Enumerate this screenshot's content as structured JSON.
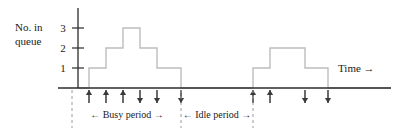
{
  "figure": {
    "kind": "queueing-step-diagram",
    "axis_color": "#2b2b2b",
    "step_color": "#bdbdbd",
    "arrow_color": "#3a3a3a",
    "guide_color": "#9a9a9a",
    "background": "#ffffff"
  },
  "y_axis": {
    "label_line1": "No. in",
    "label_line2": "queue",
    "ticks": [
      {
        "value": "3",
        "y": 28
      },
      {
        "value": "2",
        "y": 48
      },
      {
        "value": "1",
        "y": 68
      }
    ],
    "axis_x": 78,
    "axis_top": 8,
    "baseline_y": 88
  },
  "x_axis": {
    "label": "Time →",
    "label_x": 338,
    "label_y": 72,
    "start_x": 58,
    "end_x": 391
  },
  "chart_data": {
    "type": "line",
    "title": "",
    "xlabel": "Time",
    "ylabel": "No. in queue",
    "ylim": [
      0,
      3
    ],
    "step_points": [
      {
        "x": 78,
        "y": 0
      },
      {
        "x": 89,
        "y": 0
      },
      {
        "x": 89,
        "y": 1
      },
      {
        "x": 106,
        "y": 1
      },
      {
        "x": 106,
        "y": 2
      },
      {
        "x": 123,
        "y": 2
      },
      {
        "x": 123,
        "y": 3
      },
      {
        "x": 140,
        "y": 3
      },
      {
        "x": 140,
        "y": 2
      },
      {
        "x": 157,
        "y": 2
      },
      {
        "x": 157,
        "y": 1
      },
      {
        "x": 181,
        "y": 1
      },
      {
        "x": 181,
        "y": 0
      },
      {
        "x": 253,
        "y": 0
      },
      {
        "x": 253,
        "y": 1
      },
      {
        "x": 270,
        "y": 1
      },
      {
        "x": 270,
        "y": 2
      },
      {
        "x": 305,
        "y": 2
      },
      {
        "x": 305,
        "y": 1
      },
      {
        "x": 328,
        "y": 1
      },
      {
        "x": 328,
        "y": 0
      },
      {
        "x": 391,
        "y": 0
      }
    ]
  },
  "arrivals": [
    {
      "x": 89
    },
    {
      "x": 106
    },
    {
      "x": 123
    },
    {
      "x": 253
    },
    {
      "x": 270
    }
  ],
  "departures": [
    {
      "x": 140
    },
    {
      "x": 157
    },
    {
      "x": 181
    },
    {
      "x": 305
    },
    {
      "x": 328
    }
  ],
  "guides": [
    {
      "x": 72
    },
    {
      "x": 181
    },
    {
      "x": 253
    }
  ],
  "periods": [
    {
      "label": "← Busy period →",
      "center_x": 127,
      "y": 118
    },
    {
      "label": "← Idle period →",
      "center_x": 217,
      "y": 118
    }
  ]
}
